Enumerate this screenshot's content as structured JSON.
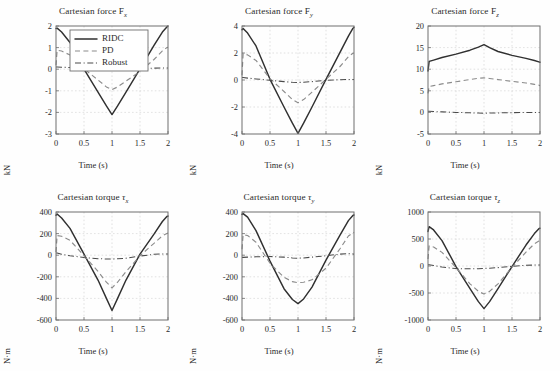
{
  "figure": {
    "title": "",
    "background": "#ffffff",
    "rows": 2,
    "cols": 3
  },
  "legend": {
    "position": "top-left of first subplot",
    "entries": [
      {
        "label": "RIDC",
        "style": "solid",
        "color": "#303030"
      },
      {
        "label": "PD",
        "style": "dashed",
        "color": "#8c8c8c"
      },
      {
        "label": "Robust",
        "style": "dash-dotted",
        "color": "#4a4a4a"
      }
    ]
  },
  "axis_common": {
    "xlabel": "Time (s)",
    "xlim": [
      0,
      2
    ],
    "xticks": [
      0,
      0.5,
      1,
      1.5,
      2
    ],
    "xticklabels": [
      "0",
      "0.5",
      "1",
      "1.5",
      "2"
    ],
    "grid": true
  },
  "chart_data": [
    {
      "id": "force-x",
      "type": "line",
      "title": "Cartesian force F",
      "title_sub": "x",
      "xlabel": "Time (s)",
      "ylabel": "kN",
      "xlim": [
        0,
        2
      ],
      "ylim": [
        -3,
        2
      ],
      "xticks": [
        0,
        0.5,
        1,
        1.5,
        2
      ],
      "xticklabels": [
        "0",
        "0.5",
        "1",
        "1.5",
        "2"
      ],
      "yticks": [
        2,
        1,
        0,
        -1,
        -2,
        -3
      ],
      "yticklabels": [
        "2",
        "1",
        "0",
        "-1",
        "-2",
        "-3"
      ],
      "grid": true,
      "legend": true,
      "x": [
        0,
        0.02,
        0.1,
        0.25,
        0.5,
        0.75,
        0.9,
        1.0,
        1.1,
        1.25,
        1.5,
        1.75,
        1.9,
        1.98,
        2.0
      ],
      "series": [
        {
          "name": "RIDC",
          "values": [
            1.88,
            1.9,
            1.72,
            1.24,
            0.0,
            -1.06,
            -1.7,
            -2.1,
            -1.7,
            -1.06,
            0.02,
            1.1,
            1.72,
            1.95,
            2.0
          ]
        },
        {
          "name": "PD",
          "values": [
            0.18,
            0.88,
            0.84,
            0.66,
            0.02,
            -0.5,
            -0.82,
            -0.95,
            -0.82,
            -0.55,
            -0.1,
            0.45,
            0.85,
            1.0,
            1.02
          ]
        },
        {
          "name": "Robust",
          "values": [
            0.1,
            0.1,
            0.09,
            0.08,
            0.05,
            0.03,
            0.02,
            0.02,
            0.02,
            0.03,
            0.04,
            0.05,
            0.06,
            0.06,
            0.06
          ]
        }
      ]
    },
    {
      "id": "force-y",
      "type": "line",
      "title": "Cartesian force F",
      "title_sub": "y",
      "xlabel": "Time (s)",
      "ylabel": "kN",
      "xlim": [
        0,
        2
      ],
      "ylim": [
        -4,
        4
      ],
      "xticks": [
        0,
        0.5,
        1,
        1.5,
        2
      ],
      "xticklabels": [
        "0",
        "0.5",
        "1",
        "1.5",
        "2"
      ],
      "yticks": [
        4,
        2,
        0,
        -2,
        -4
      ],
      "yticklabels": [
        "4",
        "2",
        "0",
        "-2",
        "-4"
      ],
      "grid": true,
      "legend": false,
      "x": [
        0,
        0.02,
        0.1,
        0.25,
        0.5,
        0.75,
        0.9,
        1.0,
        1.1,
        1.25,
        1.5,
        1.75,
        1.9,
        1.98,
        2.0
      ],
      "series": [
        {
          "name": "RIDC",
          "values": [
            3.72,
            3.82,
            3.48,
            2.52,
            0.05,
            -2.0,
            -3.2,
            -3.95,
            -3.2,
            -2.0,
            0.05,
            2.05,
            3.25,
            3.82,
            3.9
          ]
        },
        {
          "name": "PD",
          "values": [
            0.35,
            1.95,
            1.86,
            1.45,
            0.1,
            -0.85,
            -1.45,
            -1.68,
            -1.45,
            -0.9,
            0.05,
            1.0,
            1.72,
            1.98,
            2.0
          ]
        },
        {
          "name": "Robust",
          "values": [
            0.18,
            0.18,
            0.14,
            0.08,
            -0.02,
            -0.12,
            -0.17,
            -0.18,
            -0.17,
            -0.12,
            -0.02,
            0.02,
            0.04,
            0.04,
            0.04
          ]
        }
      ]
    },
    {
      "id": "force-z",
      "type": "line",
      "title": "Cartesian force F",
      "title_sub": "z",
      "xlabel": "Time (s)",
      "ylabel": "kN",
      "xlim": [
        0,
        2
      ],
      "ylim": [
        -5,
        20
      ],
      "xticks": [
        0,
        0.5,
        1,
        1.5,
        2
      ],
      "xticklabels": [
        "0",
        "0.5",
        "1",
        "1.5",
        "2"
      ],
      "yticks": [
        20,
        15,
        10,
        5,
        0,
        -5
      ],
      "yticklabels": [
        "20",
        "15",
        "10",
        "5",
        "0",
        "-5"
      ],
      "grid": true,
      "legend": false,
      "x": [
        0,
        0.02,
        0.1,
        0.25,
        0.5,
        0.75,
        0.9,
        1.0,
        1.1,
        1.25,
        1.5,
        1.75,
        1.9,
        1.98,
        2.0
      ],
      "series": [
        {
          "name": "RIDC",
          "values": [
            9.6,
            11.8,
            12.1,
            12.7,
            13.5,
            14.4,
            15.1,
            15.7,
            15.0,
            14.1,
            13.2,
            12.5,
            12.0,
            11.7,
            11.6
          ]
        },
        {
          "name": "PD",
          "values": [
            4.4,
            6.0,
            6.2,
            6.6,
            7.1,
            7.6,
            7.9,
            8.0,
            7.85,
            7.6,
            7.2,
            6.8,
            6.5,
            6.3,
            6.2
          ]
        },
        {
          "name": "Robust",
          "values": [
            0.25,
            0.25,
            0.2,
            0.12,
            0.0,
            -0.1,
            -0.16,
            -0.18,
            -0.16,
            -0.12,
            -0.05,
            -0.02,
            -0.02,
            -0.02,
            -0.02
          ]
        }
      ]
    },
    {
      "id": "torque-x",
      "type": "line",
      "title": "Cartesian torque ",
      "title_sub": "x",
      "title_greek": "τ",
      "xlabel": "Time (s)",
      "ylabel": "N⋅m",
      "xlim": [
        0,
        2
      ],
      "ylim": [
        -600,
        400
      ],
      "xticks": [
        0,
        0.5,
        1,
        1.5,
        2
      ],
      "xticklabels": [
        "0",
        "0.5",
        "1",
        "1.5",
        "2"
      ],
      "yticks": [
        400,
        200,
        0,
        -200,
        -400,
        -600
      ],
      "yticklabels": [
        "400",
        "200",
        "0",
        "-200",
        "-400",
        "-600"
      ],
      "grid": true,
      "legend": false,
      "x": [
        0,
        0.02,
        0.1,
        0.25,
        0.5,
        0.75,
        0.9,
        1.0,
        1.1,
        1.25,
        1.5,
        1.75,
        1.9,
        1.98,
        2.0
      ],
      "series": [
        {
          "name": "RIDC",
          "values": [
            370,
            382,
            345,
            248,
            10,
            -230,
            -400,
            -512,
            -400,
            -230,
            10,
            195,
            312,
            358,
            362
          ]
        },
        {
          "name": "PD",
          "values": [
            30,
            182,
            175,
            138,
            -5,
            -150,
            -250,
            -302,
            -250,
            -152,
            -5,
            110,
            180,
            200,
            205
          ]
        },
        {
          "name": "Robust",
          "values": [
            20,
            20,
            8,
            -5,
            -22,
            -32,
            -35,
            -35,
            -33,
            -28,
            -8,
            8,
            12,
            12,
            12
          ]
        }
      ]
    },
    {
      "id": "torque-y",
      "type": "line",
      "title": "Cartesian torque ",
      "title_sub": "y",
      "title_greek": "τ",
      "xlabel": "Time (s)",
      "ylabel": "N⋅m",
      "xlim": [
        0,
        2
      ],
      "ylim": [
        -600,
        400
      ],
      "xticks": [
        0,
        0.5,
        1,
        1.5,
        2
      ],
      "xticklabels": [
        "0",
        "0.5",
        "1",
        "1.5",
        "2"
      ],
      "yticks": [
        400,
        200,
        0,
        -200,
        -400,
        -600
      ],
      "yticklabels": [
        "400",
        "200",
        "0",
        "-200",
        "-400",
        "-600"
      ],
      "grid": true,
      "legend": false,
      "x": [
        0,
        0.02,
        0.1,
        0.25,
        0.5,
        0.75,
        0.9,
        1.0,
        1.1,
        1.25,
        1.5,
        1.75,
        1.9,
        1.98,
        2.0
      ],
      "series": [
        {
          "name": "RIDC",
          "values": [
            378,
            385,
            352,
            228,
            -55,
            -310,
            -410,
            -448,
            -405,
            -295,
            -45,
            185,
            320,
            368,
            372
          ]
        },
        {
          "name": "PD",
          "values": [
            55,
            190,
            182,
            120,
            -75,
            -205,
            -245,
            -255,
            -250,
            -228,
            -120,
            60,
            178,
            205,
            212
          ]
        },
        {
          "name": "Robust",
          "values": [
            -20,
            -20,
            -18,
            -15,
            -12,
            -18,
            -25,
            -28,
            -25,
            -18,
            -5,
            10,
            15,
            12,
            10
          ]
        }
      ]
    },
    {
      "id": "torque-z",
      "type": "line",
      "title": "Cartesian torque ",
      "title_sub": "z",
      "title_greek": "τ",
      "xlabel": "Time (s)",
      "ylabel": "N⋅m",
      "xlim": [
        0,
        2
      ],
      "ylim": [
        -1000,
        1000
      ],
      "xticks": [
        0,
        0.5,
        1,
        1.5,
        2
      ],
      "xticklabels": [
        "0",
        "0.5",
        "1",
        "1.5",
        "2"
      ],
      "yticks": [
        1000,
        500,
        0,
        -500,
        -1000
      ],
      "yticklabels": [
        "1000",
        "500",
        "0",
        "-500",
        "-1000"
      ],
      "grid": true,
      "legend": false,
      "x": [
        0,
        0.02,
        0.1,
        0.25,
        0.5,
        0.75,
        0.9,
        1.0,
        1.1,
        1.25,
        1.5,
        1.75,
        1.9,
        1.98,
        2.0
      ],
      "series": [
        {
          "name": "RIDC",
          "values": [
            640,
            728,
            668,
            470,
            -10,
            -420,
            -660,
            -790,
            -660,
            -420,
            -10,
            388,
            600,
            690,
            700
          ]
        },
        {
          "name": "PD",
          "values": [
            130,
            372,
            352,
            252,
            -30,
            -330,
            -470,
            -520,
            -470,
            -330,
            -25,
            258,
            412,
            462,
            470
          ]
        },
        {
          "name": "Robust",
          "values": [
            25,
            25,
            10,
            -20,
            -48,
            -52,
            -50,
            -45,
            -40,
            -30,
            -5,
            12,
            18,
            18,
            18
          ]
        }
      ]
    }
  ]
}
